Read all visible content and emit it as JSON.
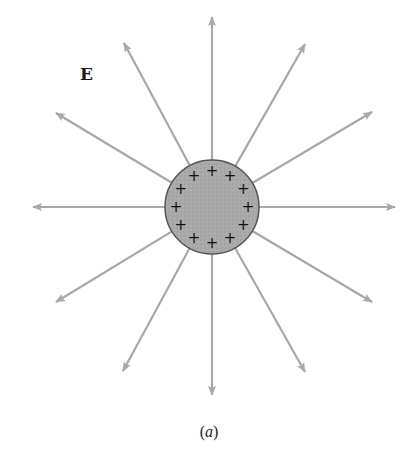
{
  "figure": {
    "field_label": "E",
    "caption_open": "(",
    "caption_letter": "a",
    "caption_close": ")",
    "charge_symbol": "+",
    "charge_count": 12,
    "field_line_count": 12,
    "colors": {
      "field_line": "#a8a8a8",
      "sphere_fill": "#a6a6a6",
      "sphere_stroke": "#555555",
      "charge": "#111111"
    },
    "sphere": {
      "cx": 212,
      "cy": 207,
      "r": 47
    },
    "field_lines": [
      {
        "direction": "N",
        "tip": [
          212,
          17
        ]
      },
      {
        "direction": "NNE",
        "tip": [
          305,
          44
        ]
      },
      {
        "direction": "ENE",
        "tip": [
          372,
          112
        ]
      },
      {
        "direction": "E",
        "tip": [
          395,
          207
        ]
      },
      {
        "direction": "ESE",
        "tip": [
          372,
          302
        ]
      },
      {
        "direction": "SSE",
        "tip": [
          305,
          372
        ]
      },
      {
        "direction": "S",
        "tip": [
          212,
          395
        ]
      },
      {
        "direction": "SSW",
        "tip": [
          123,
          371
        ]
      },
      {
        "direction": "WSW",
        "tip": [
          56,
          302
        ]
      },
      {
        "direction": "W",
        "tip": [
          33,
          207
        ]
      },
      {
        "direction": "WNW",
        "tip": [
          56,
          113
        ]
      },
      {
        "direction": "NNW",
        "tip": [
          124,
          43
        ]
      }
    ]
  }
}
